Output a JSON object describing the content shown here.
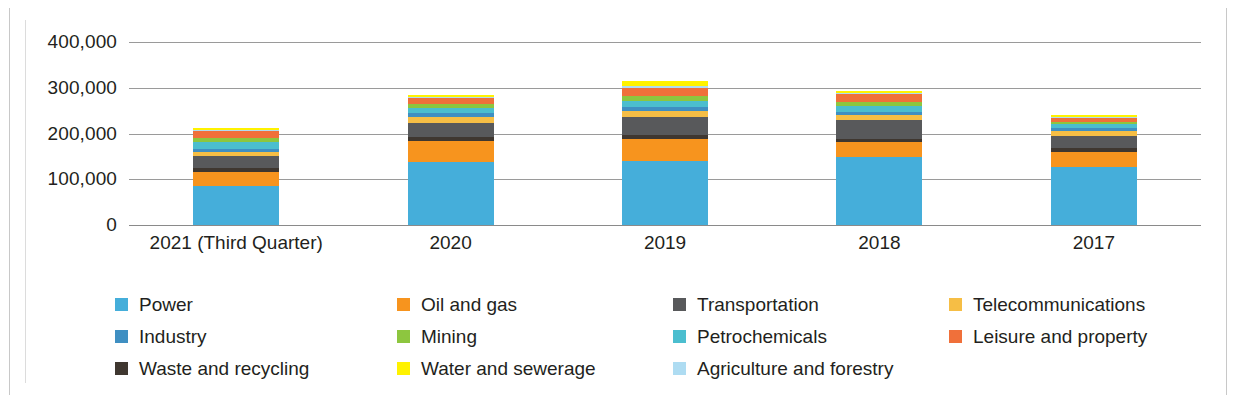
{
  "chart_data": {
    "type": "bar",
    "stacked": true,
    "title": "",
    "subtitle": "",
    "xlabel": "",
    "ylabel": "",
    "ylim": [
      0,
      400000
    ],
    "yticks": [
      "0",
      "100,000",
      "200,000",
      "300,000",
      "400,000"
    ],
    "ytick_values": [
      0,
      100000,
      200000,
      300000,
      400000
    ],
    "grid": true,
    "legend_position": "bottom",
    "legend_columns": 4,
    "categories": [
      "2021 (Third Quarter)",
      "2020",
      "2019",
      "2018",
      "2017"
    ],
    "series": [
      {
        "name": "Power",
        "color": "#45AEDA",
        "values": [
          85000,
          138000,
          140000,
          148000,
          127000
        ]
      },
      {
        "name": "Oil and gas",
        "color": "#F7941E",
        "values": [
          30000,
          45000,
          48000,
          33000,
          32000
        ]
      },
      {
        "name": "Waste and recycling",
        "color": "#3F3730",
        "values": [
          9000,
          9000,
          9000,
          8000,
          9000
        ]
      },
      {
        "name": "Transportation",
        "color": "#58595B",
        "values": [
          26000,
          32000,
          40000,
          40000,
          27000
        ]
      },
      {
        "name": "Telecommunications",
        "color": "#F6BE45",
        "values": [
          10000,
          12000,
          12000,
          11000,
          10000
        ]
      },
      {
        "name": "Industry",
        "color": "#3F8FC2",
        "values": [
          7000,
          8000,
          8000,
          8000,
          7000
        ]
      },
      {
        "name": "Petrochemicals",
        "color": "#4BBECF",
        "values": [
          14000,
          12000,
          14000,
          12000,
          8000
        ]
      },
      {
        "name": "Mining",
        "color": "#8DC63F",
        "values": [
          9000,
          8000,
          11000,
          9000,
          5000
        ]
      },
      {
        "name": "Leisure and property",
        "color": "#F0703A",
        "values": [
          15000,
          13000,
          18000,
          17000,
          10000
        ]
      },
      {
        "name": "Agriculture and forestry",
        "color": "#AEDCF2",
        "values": [
          3000,
          3000,
          5000,
          3000,
          2000
        ]
      },
      {
        "name": "Water and sewerage",
        "color": "#FFF200",
        "values": [
          4000,
          4000,
          10000,
          3000,
          3000
        ]
      }
    ],
    "totals": [
      212000,
      284000,
      315000,
      292000,
      240000
    ]
  },
  "legend": {
    "items": [
      {
        "label": "Power",
        "color": "#45AEDA"
      },
      {
        "label": "Oil and gas",
        "color": "#F7941E"
      },
      {
        "label": "Transportation",
        "color": "#58595B"
      },
      {
        "label": "Telecommunications",
        "color": "#F6BE45"
      },
      {
        "label": "Industry",
        "color": "#3F8FC2"
      },
      {
        "label": "Mining",
        "color": "#8DC63F"
      },
      {
        "label": "Petrochemicals",
        "color": "#4BBECF"
      },
      {
        "label": "Leisure and property",
        "color": "#F0703A"
      },
      {
        "label": "Waste and recycling",
        "color": "#3F3730"
      },
      {
        "label": "Water and sewerage",
        "color": "#FFF200"
      },
      {
        "label": "Agriculture and forestry",
        "color": "#AEDCF2"
      }
    ]
  }
}
